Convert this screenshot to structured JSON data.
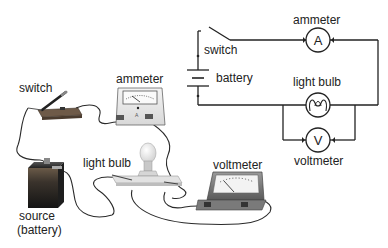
{
  "illustration": {
    "labels": {
      "switch": "switch",
      "ammeter": "ammeter",
      "light_bulb": "light bulb",
      "voltmeter": "voltmeter",
      "source_line1": "source",
      "source_line2": "(battery)"
    },
    "components": [
      {
        "name": "switch",
        "type": "knife-switch"
      },
      {
        "name": "ammeter",
        "type": "analog-meter",
        "dial_letter": "A"
      },
      {
        "name": "source",
        "type": "battery"
      },
      {
        "name": "light bulb",
        "type": "bulb-on-stand"
      },
      {
        "name": "voltmeter",
        "type": "analog-meter"
      }
    ]
  },
  "schematic": {
    "labels": {
      "ammeter": "ammeter",
      "switch": "switch",
      "battery": "battery",
      "light_bulb": "light bulb",
      "voltmeter": "voltmeter"
    },
    "symbols": {
      "ammeter": "A",
      "voltmeter": "V"
    },
    "connections": [
      "battery - switch - ammeter - loop right side - light bulb - battery (series)",
      "voltmeter in parallel with light bulb"
    ]
  },
  "colors": {
    "line": "#222222",
    "label": "#222222",
    "background": "#ffffff"
  }
}
